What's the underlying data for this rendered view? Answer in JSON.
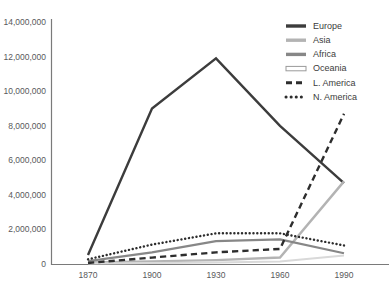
{
  "chart_data": {
    "type": "line",
    "title": "",
    "xlabel": "",
    "ylabel": "",
    "x": [
      1870,
      1900,
      1930,
      1960,
      1990
    ],
    "categories": [
      "1870",
      "1900",
      "1930",
      "1960",
      "1990"
    ],
    "xlim": [
      1858,
      2002
    ],
    "ylim": [
      0,
      14000000
    ],
    "grid": false,
    "legend_position": "top-right",
    "ytick_labels": [
      "0",
      "2,000,000",
      "4,000,000",
      "6,000,000",
      "8,000,000",
      "10,000,000",
      "12,000,000",
      "14,000,000"
    ],
    "ytick_values": [
      0,
      2000000,
      4000000,
      6000000,
      8000000,
      10000000,
      12000000,
      14000000
    ],
    "series": [
      {
        "name": "Europe",
        "values": [
          550000,
          9000000,
          11900000,
          8000000,
          4700000
        ],
        "color": "#3c3c3c",
        "style": "solid",
        "width": 2.4
      },
      {
        "name": "Asia",
        "values": [
          120000,
          180000,
          250000,
          400000,
          4800000
        ],
        "color": "#b3b3b3",
        "style": "solid",
        "width": 2.4
      },
      {
        "name": "Africa",
        "values": [
          200000,
          700000,
          1350000,
          1450000,
          650000
        ],
        "color": "#878787",
        "style": "solid",
        "width": 2.2
      },
      {
        "name": "Oceania",
        "values": [
          60000,
          80000,
          110000,
          180000,
          520000
        ],
        "color": "#d9d9d9",
        "style": "solid",
        "width": 2.0
      },
      {
        "name": "L. America",
        "values": [
          90000,
          400000,
          700000,
          900000,
          8700000
        ],
        "color": "#2d2d2d",
        "style": "dashed",
        "width": 2.4
      },
      {
        "name": "N. America",
        "values": [
          300000,
          1150000,
          1800000,
          1800000,
          1100000
        ],
        "color": "#2d2d2d",
        "style": "dotted",
        "width": 2.4
      }
    ]
  },
  "legend": {
    "items": [
      {
        "label": "Europe",
        "swatch": "solid-dark"
      },
      {
        "label": "Asia",
        "swatch": "solid-light"
      },
      {
        "label": "Africa",
        "swatch": "solid-medium"
      },
      {
        "label": "Oceania",
        "swatch": "outline"
      },
      {
        "label": "L. America",
        "swatch": "dashed-dark"
      },
      {
        "label": "N. America",
        "swatch": "dotted-dark"
      }
    ]
  }
}
